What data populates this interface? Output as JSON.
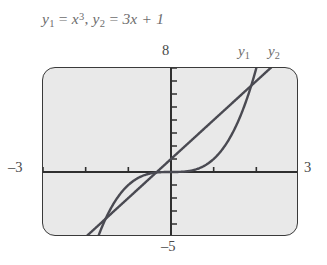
{
  "caption": {
    "full_text": "y1 = x^3, y2 = 3x + 1",
    "y1_var": "y",
    "y1_sub": "1",
    "eq1": " = ",
    "y1_expr_base": "x",
    "y1_expr_exp": "3",
    "comma": ", ",
    "y2_var": "y",
    "y2_sub": "2",
    "eq2": " = ",
    "y2_expr": "3x + 1"
  },
  "axis_labels": {
    "ymax": "8",
    "ymin": "–5",
    "xmin": "–3",
    "xmax": "3"
  },
  "curve_labels": {
    "y1_var": "y",
    "y1_sub": "1",
    "y2_var": "y",
    "y2_sub": "2"
  },
  "colors": {
    "frame_border": "#3a3a3a",
    "screen_background": "#e9e9e9",
    "axis": "#2f2f2f",
    "curve": "#4a4a52",
    "text": "#6d6d6d",
    "label_text": "#4a4a4a",
    "page_background": "#ffffff"
  },
  "chart_data": {
    "type": "line",
    "xlabel": "",
    "ylabel": "",
    "xlim": [
      -3,
      3
    ],
    "ylim": [
      -5,
      8
    ],
    "grid": false,
    "legend_position": "top-right",
    "x_tick_interval": 1,
    "y_tick_interval": 1,
    "x_ticks": [
      -3,
      -2,
      -1,
      0,
      1,
      2,
      3
    ],
    "y_ticks": [
      -5,
      -4,
      -3,
      -2,
      -1,
      0,
      1,
      2,
      3,
      4,
      5,
      6,
      7,
      8
    ],
    "axis_end_labels": {
      "top": "8",
      "bottom": "-5",
      "left": "-3",
      "right": "3"
    },
    "series": [
      {
        "name": "y1",
        "label": "y1",
        "expression": "x^3",
        "x": [
          -3,
          -2.8,
          -2.6,
          -2.4,
          -2.2,
          -2,
          -1.8,
          -1.6,
          -1.4,
          -1.2,
          -1,
          -0.8,
          -0.6,
          -0.4,
          -0.2,
          0,
          0.2,
          0.4,
          0.6,
          0.8,
          1,
          1.2,
          1.4,
          1.6,
          1.8,
          2,
          2.2,
          2.4,
          2.6,
          2.8,
          3
        ],
        "values": [
          -27,
          -21.952,
          -17.576,
          -13.824,
          -10.648,
          -8,
          -5.832,
          -4.096,
          -2.744,
          -1.728,
          -1,
          -0.512,
          -0.216,
          -0.064,
          -0.008,
          0,
          0.008,
          0.064,
          0.216,
          0.512,
          1,
          1.728,
          2.744,
          4.096,
          5.832,
          8,
          10.648,
          13.824,
          17.576,
          21.952,
          27
        ]
      },
      {
        "name": "y2",
        "label": "y2",
        "expression": "3x + 1",
        "x": [
          -3,
          -2,
          -1,
          0,
          1,
          2,
          3
        ],
        "values": [
          -8,
          -5,
          -2,
          1,
          4,
          7,
          10
        ]
      }
    ],
    "annotations": [
      {
        "text": "y1",
        "x": 2.55,
        "y": 8.6
      },
      {
        "text": "y2",
        "x": 3.0,
        "y": 8.6
      }
    ]
  }
}
